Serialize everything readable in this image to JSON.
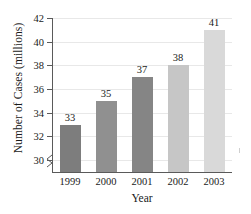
{
  "chart_data": {
    "type": "bar",
    "title": "",
    "xlabel": "Year",
    "ylabel": "Number of Cases (millions)",
    "categories": [
      "1999",
      "2000",
      "2001",
      "2002",
      "2003"
    ],
    "values": [
      33,
      35,
      37,
      38,
      41
    ],
    "value_labels": [
      "33",
      "35",
      "37",
      "38",
      "41"
    ],
    "ylim": [
      29,
      42
    ],
    "yticks": [
      30,
      32,
      34,
      36,
      38,
      40,
      42
    ],
    "ytick_labels": [
      "30",
      "32",
      "34",
      "36",
      "38",
      "40",
      "42"
    ],
    "grid": true,
    "legend": "none",
    "axis_break": true,
    "bar_colors": [
      "#7d7d7d",
      "#909090",
      "#858585",
      "#c6c6c6",
      "#d9d9d9"
    ],
    "axis_color": "#5a5a5a",
    "grid_color": "#e8e8e8",
    "text_color": "#1a1a1a"
  }
}
